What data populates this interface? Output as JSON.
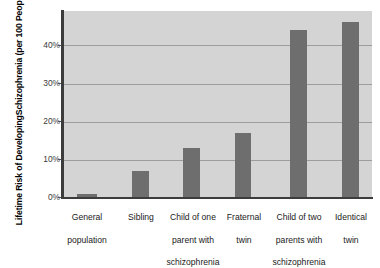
{
  "chart_data": {
    "type": "bar",
    "title": "",
    "xlabel": "",
    "ylabel": "Lifetime Risk of Developing Schizophrenia (per 100 People)",
    "ylabel_lines": [
      "Lifetime Risk of Developing",
      "Schizophrenia (per 100 People)"
    ],
    "categories": [
      "General population",
      "Sibling",
      "Child of one parent with schizophrenia",
      "Fraternal twin",
      "Child of two parents with schizophrenia",
      "Identical twin"
    ],
    "category_lines": [
      [
        "General",
        "population"
      ],
      [
        "Sibling"
      ],
      [
        "Child of one",
        "parent with",
        "schizophrenia"
      ],
      [
        "Fraternal",
        "twin"
      ],
      [
        "Child of two",
        "parents with",
        "schizophrenia"
      ],
      [
        "Identical",
        "twin"
      ]
    ],
    "values": [
      1,
      7,
      13,
      17,
      44,
      46
    ],
    "ylim": [
      0,
      49
    ],
    "yticks": [
      0,
      10,
      20,
      30,
      40
    ],
    "ytick_labels": [
      "0%",
      "10%",
      "20%",
      "30%",
      "40%"
    ],
    "grid": true,
    "legend": "none",
    "colors": {
      "bar": "#6e6e6e",
      "plot_background": "#d4d4d4",
      "gridline": "#9d9d9d",
      "axis": "#3c3c3c",
      "figure_background": "#ffffff",
      "text": "#1a1a1a"
    }
  }
}
